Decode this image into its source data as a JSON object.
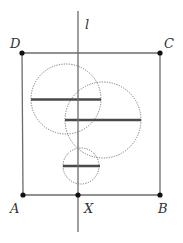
{
  "labels": {
    "line": "l",
    "A": "A",
    "B": "B",
    "C": "C",
    "D": "D",
    "X": "X"
  },
  "colors": {
    "stroke": "#6b6b6b",
    "thick": "#4a4a4a",
    "dot": "#111111",
    "dotted": "#777777"
  },
  "geometry": {
    "square": {
      "A": [
        23,
        195
      ],
      "B": [
        160,
        195
      ],
      "C": [
        160,
        53
      ],
      "D": [
        22,
        53
      ]
    },
    "line_l": {
      "x": 78,
      "y1": 11,
      "y2": 232
    },
    "X": [
      78,
      195
    ],
    "circles": [
      {
        "cx": 66,
        "cy": 99,
        "r": 35,
        "chord": [
          31,
          101
        ]
      },
      {
        "cx": 103,
        "cy": 120,
        "r": 38,
        "chord": [
          65,
          141
        ]
      },
      {
        "cx": 81,
        "cy": 166,
        "r": 18,
        "chord": [
          63,
          100
        ]
      }
    ]
  }
}
